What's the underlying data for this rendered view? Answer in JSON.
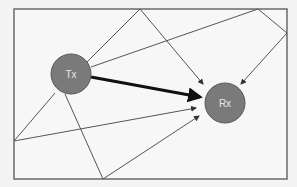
{
  "diagram": {
    "frame": {
      "x1": 14,
      "y1": 9,
      "x2": 287,
      "y2": 179,
      "stroke": "#6a6a6a"
    },
    "nodes": [
      {
        "id": "tx",
        "label": "Tx",
        "cx": 71,
        "cy": 74,
        "r": 20,
        "fill": "#7a7a7a",
        "stroke": "#5a5a5a"
      },
      {
        "id": "rx",
        "label": "Rx",
        "cx": 225,
        "cy": 103,
        "r": 20,
        "fill": "#7a7a7a",
        "stroke": "#5a5a5a"
      }
    ],
    "direct_path": {
      "from": "tx",
      "to": "rx",
      "color": "#111111",
      "width": 3
    },
    "reflection_points": [
      {
        "name": "top-left-reflection",
        "x": 140,
        "y": 9
      },
      {
        "name": "top-right-reflection",
        "x": 258,
        "y": 9
      },
      {
        "name": "right-reflection",
        "x": 287,
        "y": 33
      },
      {
        "name": "left-reflection",
        "x": 14,
        "y": 141
      },
      {
        "name": "bottom-reflection",
        "x": 103,
        "y": 179
      }
    ],
    "path_color": "#555555"
  }
}
